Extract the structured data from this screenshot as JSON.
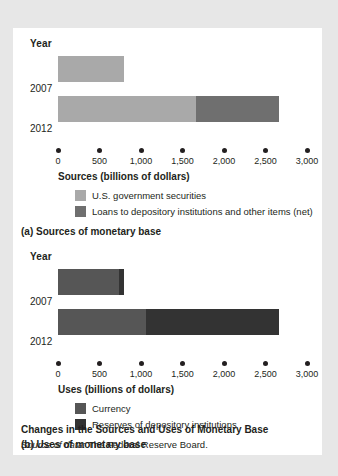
{
  "figure": {
    "title": "Changes in the Sources and Uses of Monetary Base",
    "source_prefix": "Source of data:",
    "source_text": " The Federal Reserve Board.",
    "background_color": "#e7e7e7",
    "card_color": "#ffffff"
  },
  "panel_a": {
    "year_header": "Year",
    "caption": "(a) Sources of monetary base",
    "axis_title": "Sources (billions of dollars)",
    "year_labels": [
      "2007",
      "2012"
    ],
    "tick_labels": [
      "0",
      "500",
      "1,000",
      "1,500",
      "2,000",
      "2,500",
      "3,000"
    ],
    "legend": [
      {
        "label": "U.S. government securities",
        "color": "#a9a9a9"
      },
      {
        "label": "Loans to depository institutions and other items (net)",
        "color": "#6f6f6f"
      }
    ]
  },
  "panel_b": {
    "year_header": "Year",
    "caption": "(b) Uses of monetary base",
    "axis_title": "Uses (billions of dollars)",
    "year_labels": [
      "2007",
      "2012"
    ],
    "tick_labels": [
      "0",
      "500",
      "1,000",
      "1,500",
      "2,000",
      "2,500",
      "3,000"
    ],
    "legend": [
      {
        "label": "Currency",
        "color": "#565656"
      },
      {
        "label": "Reserves of depository institutions",
        "color": "#333333"
      }
    ]
  },
  "chart_data": [
    {
      "type": "bar",
      "orientation": "horizontal",
      "stacked": true,
      "title": "(a) Sources of monetary base",
      "xlabel": "Sources (billions of dollars)",
      "ylabel": "Year",
      "categories": [
        "2007",
        "2012"
      ],
      "xlim": [
        0,
        3000
      ],
      "xticks": [
        0,
        500,
        1000,
        1500,
        2000,
        2500,
        3000
      ],
      "grid": false,
      "legend_position": "below-axis",
      "series": [
        {
          "name": "U.S. government securities",
          "color": "#a9a9a9",
          "values": [
            800,
            1660
          ]
        },
        {
          "name": "Loans to depository institutions and other items (net)",
          "color": "#6f6f6f",
          "values": [
            0,
            1000
          ]
        }
      ],
      "totals": [
        800,
        2660
      ]
    },
    {
      "type": "bar",
      "orientation": "horizontal",
      "stacked": true,
      "title": "(b) Uses of monetary base",
      "xlabel": "Uses (billions of dollars)",
      "ylabel": "Year",
      "categories": [
        "2007",
        "2012"
      ],
      "xlim": [
        0,
        3000
      ],
      "xticks": [
        0,
        500,
        1000,
        1500,
        2000,
        2500,
        3000
      ],
      "grid": false,
      "legend_position": "below-axis",
      "series": [
        {
          "name": "Currency",
          "color": "#565656",
          "values": [
            740,
            1060
          ]
        },
        {
          "name": "Reserves of depository institutions",
          "color": "#333333",
          "values": [
            50,
            1600
          ]
        }
      ],
      "totals": [
        790,
        2660
      ]
    }
  ]
}
